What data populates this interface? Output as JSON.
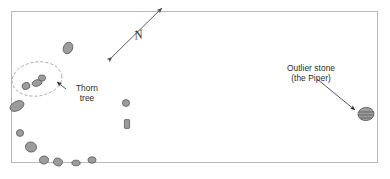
{
  "figure": {
    "kind": "archaeological-site-plan",
    "background_color": "#ffffff",
    "frame": {
      "name": "plan-border",
      "color": "#b9b9b9",
      "x": 11,
      "y": 11,
      "width": 367,
      "height": 152
    }
  },
  "annotations": {
    "north_arrow": {
      "label": "N",
      "color": "#4a4a4a",
      "double_headed": true,
      "from": [
        112,
        57
      ],
      "to": [
        162,
        8
      ]
    },
    "thorn_tree": {
      "line1": "Thorn",
      "line2": "tree",
      "color": "#2c2c2c",
      "leader_from": [
        66,
        88
      ],
      "leader_to": [
        55,
        81
      ]
    },
    "outlier_stone": {
      "line1": "Outlier stone",
      "line2": "(the Piper)",
      "color": "#2c2c2c",
      "leader_from": [
        317,
        79
      ],
      "leader_to": [
        356,
        110
      ]
    }
  },
  "map_features": {
    "thorn_tree_enclosure": {
      "name": "dashed-ellipse",
      "cx": 37,
      "cy": 79,
      "rx": 25,
      "ry": 17,
      "rotation": -8,
      "stroke": "#9a9a9a",
      "dash": "3,2"
    },
    "stone_style": {
      "fill": "#9c9c9c",
      "stroke": "#5b5b5b"
    },
    "stones": [
      {
        "id": "s01",
        "group": "scatter-north",
        "cx": 68,
        "cy": 48,
        "rx": 4.5,
        "ry": 6.0,
        "rot": 25
      },
      {
        "id": "s02",
        "group": "thorn-tree-cluster",
        "cx": 26,
        "cy": 86,
        "rx": 4.0,
        "ry": 3.4,
        "rot": -20
      },
      {
        "id": "s03",
        "group": "thorn-tree-cluster",
        "cx": 37,
        "cy": 83,
        "rx": 5.0,
        "ry": 3.2,
        "rot": -15
      },
      {
        "id": "s04",
        "group": "thorn-tree-cluster",
        "cx": 42,
        "cy": 78,
        "rx": 3.6,
        "ry": 3.0,
        "rot": 10
      },
      {
        "id": "s05",
        "group": "west-arc",
        "cx": 17,
        "cy": 106,
        "rx": 7.5,
        "ry": 4.6,
        "rot": -28
      },
      {
        "id": "s06",
        "group": "west-arc",
        "cx": 20,
        "cy": 133,
        "rx": 3.6,
        "ry": 3.4,
        "rot": 0
      },
      {
        "id": "s07",
        "group": "west-arc",
        "cx": 31,
        "cy": 147,
        "rx": 5.6,
        "ry": 5.0,
        "rot": 15
      },
      {
        "id": "s08",
        "group": "south-arc",
        "cx": 44,
        "cy": 160,
        "rx": 4.6,
        "ry": 4.0,
        "rot": -10
      },
      {
        "id": "s09",
        "group": "south-arc",
        "cx": 58,
        "cy": 162,
        "rx": 4.4,
        "ry": 3.8,
        "rot": 20
      },
      {
        "id": "s10",
        "group": "south-arc",
        "cx": 76,
        "cy": 163,
        "rx": 4.2,
        "ry": 2.8,
        "rot": 0
      },
      {
        "id": "s11",
        "group": "south-arc",
        "cx": 92,
        "cy": 160,
        "rx": 4.0,
        "ry": 3.2,
        "rot": -5
      },
      {
        "id": "s12",
        "group": "centre",
        "cx": 126,
        "cy": 103,
        "rx": 3.6,
        "ry": 3.4,
        "rot": 0
      },
      {
        "id": "s13",
        "group": "centre",
        "cx": 127,
        "cy": 124,
        "rx": 2.6,
        "ry": 4.4,
        "rot": 0,
        "shape": "rect"
      },
      {
        "id": "s14",
        "group": "outlier",
        "cx": 366,
        "cy": 114,
        "rx": 8.0,
        "ry": 6.6,
        "rot": -6,
        "hatched": true
      }
    ]
  }
}
